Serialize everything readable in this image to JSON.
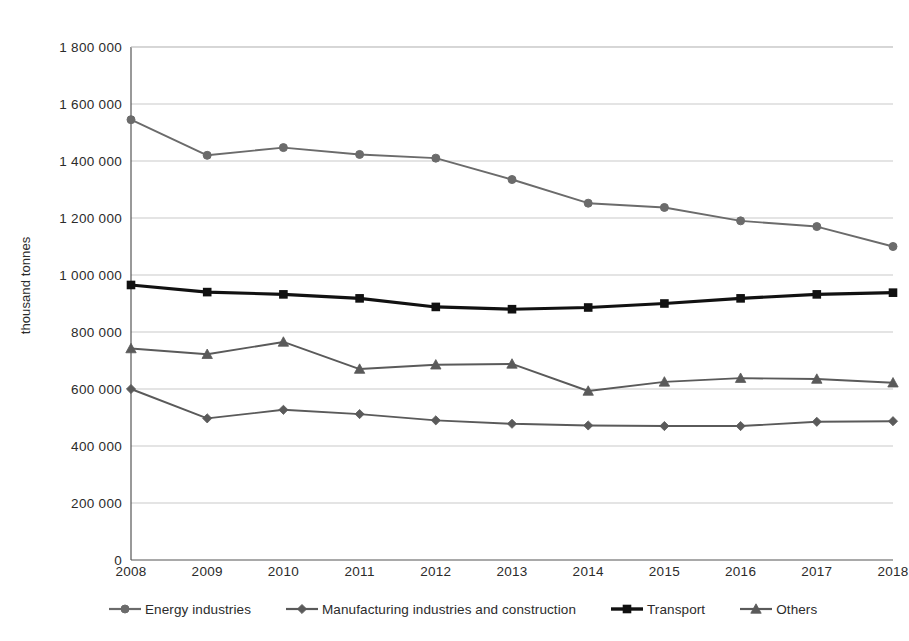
{
  "chart_data": {
    "type": "line",
    "title": "",
    "subtitle": "",
    "xlabel": "",
    "ylabel": "thousand tonnes",
    "categories": [
      "2008",
      "2009",
      "2010",
      "2011",
      "2012",
      "2013",
      "2014",
      "2015",
      "2016",
      "2017",
      "2018"
    ],
    "x": [
      2008,
      2009,
      2010,
      2011,
      2012,
      2013,
      2014,
      2015,
      2016,
      2017,
      2018
    ],
    "ylim": [
      0,
      1800000
    ],
    "ytick_values": [
      0,
      200000,
      400000,
      600000,
      800000,
      1000000,
      1200000,
      1400000,
      1600000,
      1800000
    ],
    "ytick_labels": [
      "0",
      "200 000",
      "400 000",
      "600 000",
      "800 000",
      "1 000 000",
      "1 200 000",
      "1 400 000",
      "1 600 000",
      "1 800 000"
    ],
    "grid": true,
    "grid_axis": "y",
    "legend_position": "bottom",
    "series": [
      {
        "name": "Energy industries",
        "marker": "circle",
        "color": "#6b6b6b",
        "values": [
          1545000,
          1420000,
          1447000,
          1423000,
          1410000,
          1335000,
          1252000,
          1237000,
          1190000,
          1170000,
          1100000
        ]
      },
      {
        "name": "Manufacturing industries and construction",
        "marker": "diamond",
        "color": "#5a5a5a",
        "values": [
          600000,
          497000,
          527000,
          512000,
          490000,
          478000,
          472000,
          470000,
          470000,
          485000,
          487000
        ]
      },
      {
        "name": "Transport",
        "marker": "square",
        "color": "#111111",
        "values": [
          965000,
          940000,
          932000,
          918000,
          888000,
          880000,
          886000,
          900000,
          918000,
          932000,
          938000
        ]
      },
      {
        "name": "Others",
        "marker": "triangle",
        "color": "#5a5a5a",
        "values": [
          742000,
          722000,
          765000,
          670000,
          685000,
          688000,
          593000,
          625000,
          638000,
          635000,
          622000
        ]
      }
    ]
  },
  "legend": {
    "items": [
      {
        "label": "Energy industries",
        "marker": "circle-marker-icon"
      },
      {
        "label": "Manufacturing industries and construction",
        "marker": "diamond-marker-icon"
      },
      {
        "label": "Transport",
        "marker": "square-marker-icon"
      },
      {
        "label": "Others",
        "marker": "triangle-marker-icon"
      }
    ]
  },
  "axes": {
    "y_label": "thousand tonnes"
  },
  "style": {
    "axis_color": "#555555",
    "grid_color": "#c9c9c9",
    "background": "#ffffff"
  }
}
